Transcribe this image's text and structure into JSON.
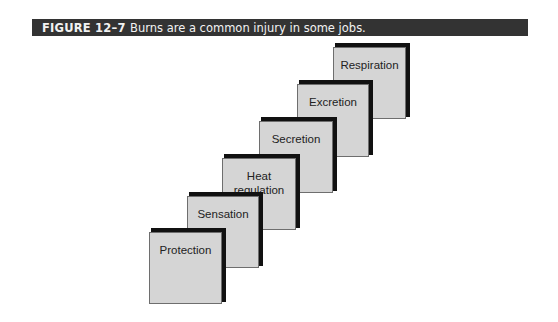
{
  "figure": {
    "label": "FIGURE 12–7",
    "caption": "Burns are a common injury in some jobs."
  },
  "diagram": {
    "type": "staircase",
    "fill_color": "#d5d5d5",
    "shadow_color": "#111111",
    "steps": [
      {
        "label": "Protection",
        "x": 149,
        "y": 232,
        "w": 73,
        "h": 72
      },
      {
        "label": "Sensation",
        "x": 187,
        "y": 196,
        "w": 72,
        "h": 72
      },
      {
        "label": "Heat\nregulation",
        "x": 222,
        "y": 158,
        "w": 74,
        "h": 72
      },
      {
        "label": "Secretion",
        "x": 259,
        "y": 121,
        "w": 74,
        "h": 72
      },
      {
        "label": "Excretion",
        "x": 297,
        "y": 84,
        "w": 72,
        "h": 73
      },
      {
        "label": "Respiration",
        "x": 333,
        "y": 47,
        "w": 73,
        "h": 72
      }
    ]
  }
}
